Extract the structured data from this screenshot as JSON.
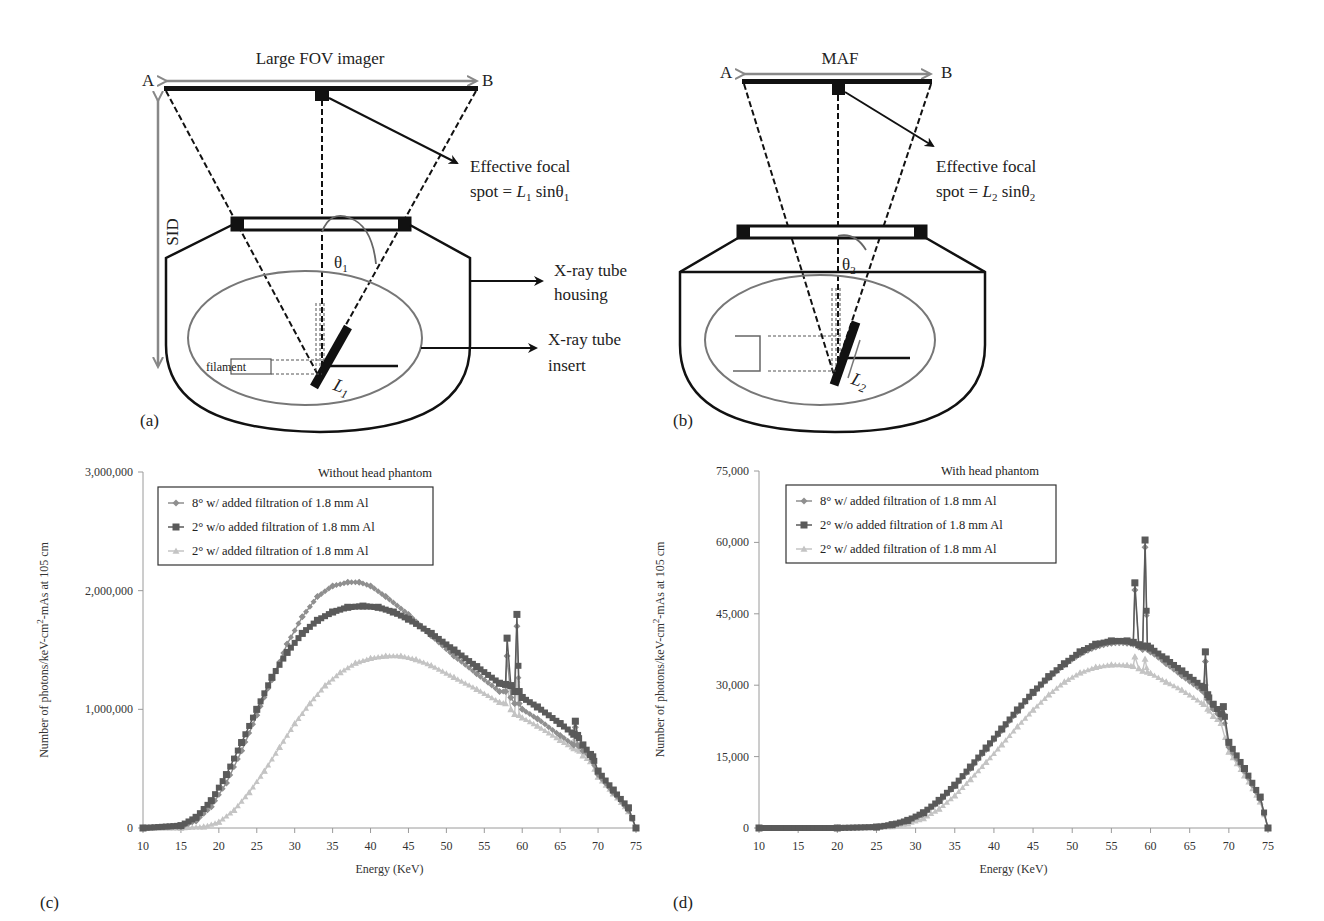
{
  "figure": {
    "panels": {
      "a": {
        "label": "(a)",
        "imager_title": "Large FOV imager",
        "point_a": "A",
        "point_b": "B",
        "sid_label": "SID",
        "focal_text_line1": "Effective focal",
        "focal_text_line2_prefix": "spot = ",
        "focal_L": "L",
        "focal_L_sub": "1",
        "focal_sin": " sin",
        "focal_theta": "θ",
        "focal_theta_sub": "1",
        "theta_label": "θ",
        "theta_sub": "1",
        "L_label": "L",
        "L_sub": "1",
        "filament_label": "filament",
        "housing_label_line1": "X-ray tube",
        "housing_label_line2": "housing",
        "insert_label_line1": "X-ray tube",
        "insert_label_line2": "insert"
      },
      "b": {
        "label": "(b)",
        "imager_title": "MAF",
        "point_a": "A",
        "point_b": "B",
        "focal_text_line1": "Effective focal",
        "focal_text_line2_prefix": "spot = ",
        "focal_L": "L",
        "focal_L_sub": "2",
        "focal_sin": " sin",
        "focal_theta": "θ",
        "focal_theta_sub": "2",
        "theta_label": "θ",
        "theta_sub": "2",
        "L_label": "L",
        "L_sub": "2"
      },
      "c": {
        "label": "(c)"
      },
      "d": {
        "label": "(d)"
      }
    },
    "colors": {
      "series_8deg_filtered": "#8f8f8f",
      "series_2deg_unfiltered": "#5a5a5a",
      "series_2deg_filtered": "#c4c4c4",
      "ellipse": "#777777",
      "axis": "#9a9a9a"
    }
  },
  "chart_data": [
    {
      "type": "line",
      "panel": "(c)",
      "title": "Without head phantom",
      "xlabel": "Energy (KeV)",
      "ylabel": "Number of photons/keV-cm²-mAs at 105 cm",
      "ylabel_parts": [
        "Number of photons/keV-cm",
        "2",
        "-mAs at 105 cm"
      ],
      "xlim": [
        10,
        75
      ],
      "ylim": [
        0,
        3000000
      ],
      "xticks": [
        "10",
        "15",
        "20",
        "25",
        "30",
        "35",
        "40",
        "45",
        "50",
        "55",
        "60",
        "65",
        "70",
        "75"
      ],
      "yticks": [
        "0",
        "1,000,000",
        "2,000,000",
        "3,000,000"
      ],
      "grid": false,
      "legend_position": "upper-left-inside",
      "series": [
        {
          "name": "8° w/ added filtration of 1.8 mm Al",
          "marker": "diamond",
          "x": [
            10,
            15,
            17,
            19,
            21,
            23,
            25,
            27,
            29,
            31,
            33,
            35,
            37,
            38.5,
            40,
            42,
            45,
            48,
            51,
            54,
            57,
            57.8,
            58,
            58.5,
            59,
            59.3,
            59.6,
            60,
            62,
            65,
            66.8,
            67,
            67.3,
            68,
            69,
            69.3,
            70,
            72,
            74,
            75
          ],
          "y": [
            0,
            10000,
            60000,
            180000,
            380000,
            650000,
            950000,
            1250000,
            1550000,
            1780000,
            1950000,
            2040000,
            2070000,
            2070000,
            2040000,
            1950000,
            1800000,
            1620000,
            1450000,
            1300000,
            1150000,
            1150000,
            1450000,
            1100000,
            1050000,
            1700000,
            1050000,
            1000000,
            920000,
            780000,
            700000,
            850000,
            700000,
            650000,
            600000,
            560000,
            450000,
            300000,
            150000,
            0
          ]
        },
        {
          "name": "2° w/o added filtration of 1.8 mm Al",
          "marker": "square",
          "x": [
            10,
            15,
            17,
            19,
            21,
            23,
            25,
            27,
            29,
            31,
            33,
            35,
            37,
            39,
            41,
            43,
            45,
            48,
            51,
            54,
            57,
            57.8,
            58,
            58.5,
            59,
            59.3,
            59.6,
            60,
            62,
            65,
            66.8,
            67,
            67.3,
            68,
            69,
            69.3,
            70,
            72,
            74,
            75
          ],
          "y": [
            0,
            20000,
            90000,
            230000,
            450000,
            720000,
            1000000,
            1270000,
            1480000,
            1640000,
            1750000,
            1820000,
            1860000,
            1870000,
            1860000,
            1820000,
            1760000,
            1640000,
            1500000,
            1360000,
            1220000,
            1210000,
            1600000,
            1200000,
            1150000,
            1800000,
            1150000,
            1100000,
            1020000,
            880000,
            790000,
            900000,
            780000,
            700000,
            620000,
            600000,
            480000,
            320000,
            170000,
            0
          ]
        },
        {
          "name": "2° w/ added filtration of 1.8 mm Al",
          "marker": "triangle",
          "x": [
            10,
            15,
            18,
            20,
            22,
            24,
            26,
            28,
            30,
            32,
            34,
            36,
            38,
            40,
            42,
            44,
            46,
            48,
            51,
            54,
            57,
            57.8,
            58,
            58.5,
            59,
            59.3,
            59.6,
            60,
            62,
            65,
            66.8,
            67,
            67.3,
            68,
            69,
            70,
            72,
            74,
            75
          ],
          "y": [
            0,
            0,
            10000,
            50000,
            150000,
            300000,
            480000,
            680000,
            880000,
            1050000,
            1200000,
            1310000,
            1390000,
            1430000,
            1450000,
            1450000,
            1420000,
            1370000,
            1270000,
            1170000,
            1060000,
            1050000,
            1200000,
            1000000,
            960000,
            1250000,
            950000,
            930000,
            860000,
            740000,
            670000,
            760000,
            660000,
            610000,
            560000,
            430000,
            290000,
            140000,
            0
          ]
        }
      ]
    },
    {
      "type": "line",
      "panel": "(d)",
      "title": "With head phantom",
      "xlabel": "Energy (KeV)",
      "ylabel": "Number of photons/keV-cm²-mAs at 105 cm",
      "ylabel_parts": [
        "Number of photons/keV-cm",
        "2",
        "-mAs at 105 cm"
      ],
      "xlim": [
        10,
        75
      ],
      "ylim": [
        0,
        75000
      ],
      "xticks": [
        "10",
        "15",
        "20",
        "25",
        "30",
        "35",
        "40",
        "45",
        "50",
        "55",
        "60",
        "65",
        "70",
        "75"
      ],
      "yticks": [
        "0",
        "15,000",
        "30,000",
        "45,000",
        "60,000",
        "75,000"
      ],
      "grid": false,
      "legend_position": "upper-left-inside",
      "series": [
        {
          "name": "8° w/ added filtration of 1.8 mm Al",
          "marker": "diamond",
          "x": [
            10,
            20,
            25,
            27,
            29,
            31,
            33,
            35,
            37,
            39,
            41,
            43,
            45,
            47,
            49,
            51,
            53,
            55,
            57,
            57.8,
            58,
            58.5,
            59,
            59.3,
            59.6,
            60,
            62,
            64,
            66.8,
            67,
            67.3,
            68,
            69,
            69.3,
            70,
            72,
            74,
            75
          ],
          "y": [
            0,
            0,
            200,
            600,
            1500,
            3000,
            5500,
            8800,
            12500,
            16500,
            20500,
            24500,
            28300,
            31500,
            34300,
            36500,
            38000,
            38800,
            38800,
            38600,
            50000,
            38000,
            37500,
            59000,
            37500,
            37000,
            34500,
            32000,
            28500,
            35000,
            27000,
            25000,
            23000,
            24000,
            17000,
            12000,
            6000,
            0
          ]
        },
        {
          "name": "2° w/o added filtration of 1.8 mm Al",
          "marker": "square",
          "x": [
            10,
            20,
            25,
            27,
            29,
            31,
            33,
            35,
            37,
            39,
            41,
            43,
            45,
            47,
            49,
            51,
            53,
            55,
            57,
            57.8,
            58,
            58.5,
            59,
            59.3,
            59.6,
            60,
            62,
            64,
            66.8,
            67,
            67.3,
            68,
            69,
            69.3,
            70,
            72,
            74,
            75
          ],
          "y": [
            0,
            0,
            200,
            700,
            1600,
            3200,
            5800,
            9000,
            12800,
            16800,
            20800,
            24800,
            28500,
            31800,
            34500,
            37000,
            38600,
            39300,
            39300,
            39000,
            51500,
            38500,
            38200,
            60500,
            38200,
            37800,
            35500,
            33000,
            29500,
            37000,
            28000,
            26000,
            24000,
            25500,
            18000,
            12500,
            6500,
            0
          ]
        },
        {
          "name": "2° w/ added filtration of 1.8 mm Al",
          "marker": "triangle",
          "x": [
            10,
            20,
            25,
            27,
            29,
            31,
            33,
            35,
            37,
            39,
            41,
            43,
            45,
            47,
            49,
            51,
            53,
            55,
            57,
            57.8,
            58,
            58.5,
            59,
            59.3,
            59.6,
            60,
            62,
            64,
            66.8,
            67,
            67.3,
            68,
            69,
            70,
            72,
            74,
            75
          ],
          "y": [
            0,
            0,
            100,
            300,
            900,
            2000,
            4000,
            6800,
            10200,
            13800,
            17500,
            21300,
            24800,
            28000,
            30700,
            32600,
            33800,
            34300,
            34200,
            34000,
            36000,
            33500,
            33000,
            35500,
            32800,
            32500,
            30700,
            29000,
            26000,
            30500,
            25000,
            23500,
            22000,
            16000,
            11000,
            5500,
            0
          ]
        }
      ]
    }
  ]
}
